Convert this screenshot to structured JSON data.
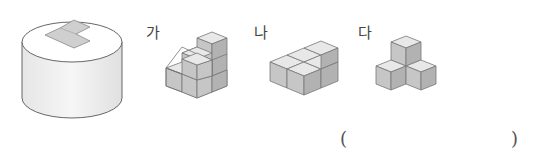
{
  "problem": {
    "base_figure": {
      "name": "cylinder-with-L-shaped-hole",
      "top_hole_shape": "L-shape (3 squares)"
    },
    "options": [
      {
        "label": "가",
        "shape": "staircase of 6 cubes (3-2-1 columns)"
      },
      {
        "label": "나",
        "shape": "5 cubes flat L-shape with one raised"
      },
      {
        "label": "다",
        "shape": "4 cubes: 3 bottom in L, 1 on top"
      }
    ],
    "answer_box": {
      "open": "(",
      "close": ")",
      "value": ""
    }
  },
  "colors": {
    "outline": "#666666",
    "top_face": "#e8e8e8",
    "left_face": "#c8c8c8",
    "right_face": "#b4b4b4",
    "hole": "#cfcfcf"
  }
}
